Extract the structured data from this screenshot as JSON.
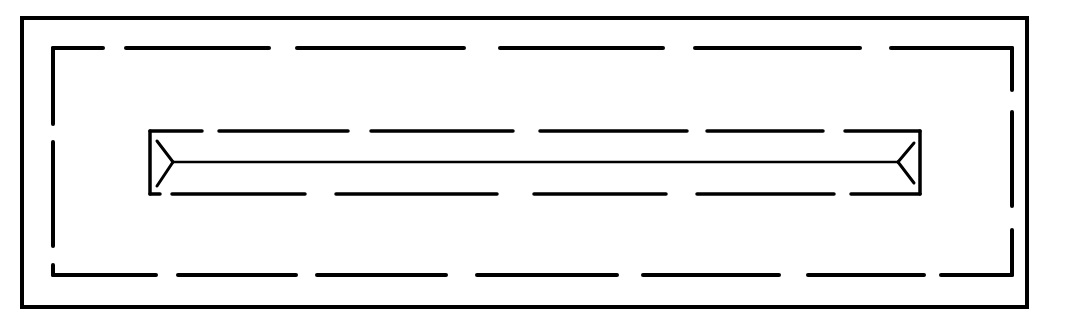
{
  "diagram": {
    "type": "line-drawing",
    "stroke_color": "#000000",
    "background_color": "#ffffff",
    "outer_frame": {
      "x": 22,
      "y": 18,
      "width": 1005,
      "height": 289,
      "stroke_width": 4
    },
    "outer_dashed_rect": {
      "left": 53,
      "right": 1012,
      "top": 48,
      "bottom": 275,
      "stroke_width": 4,
      "top_dashes": [
        [
          53,
          103
        ],
        [
          126,
          269
        ],
        [
          297,
          464
        ],
        [
          500,
          663
        ],
        [
          695,
          860
        ],
        [
          891,
          1012
        ]
      ],
      "bottom_dashes": [
        [
          53,
          156
        ],
        [
          178,
          296
        ],
        [
          317,
          446
        ],
        [
          477,
          617
        ],
        [
          643,
          779
        ],
        [
          808,
          924
        ],
        [
          941,
          1012
        ]
      ],
      "left_dashes": [
        [
          48,
          124
        ],
        [
          142,
          246
        ],
        [
          265,
          275
        ]
      ],
      "right_dashes": [
        [
          48,
          90
        ],
        [
          112,
          206
        ],
        [
          230,
          275
        ]
      ]
    },
    "inner_rect": {
      "left": 150,
      "right": 920,
      "top": 131,
      "bottom": 194,
      "stroke_width": 3.5,
      "top_dashes": [
        [
          150,
          202
        ],
        [
          219,
          348
        ],
        [
          371,
          513
        ],
        [
          540,
          687
        ],
        [
          707,
          823
        ],
        [
          845,
          920
        ]
      ],
      "bottom_dashes": [
        [
          150,
          160
        ],
        [
          172,
          305
        ],
        [
          336,
          497
        ],
        [
          534,
          666
        ],
        [
          697,
          834
        ],
        [
          851,
          920
        ]
      ],
      "left_side": [
        131,
        194
      ],
      "right_side": [
        131,
        194
      ]
    },
    "centerline": {
      "x1": 173,
      "x2": 898,
      "y": 162,
      "stroke_width": 2.5
    },
    "left_fork": {
      "tip": [
        173,
        162
      ],
      "arm_top": [
        157,
        141
      ],
      "arm_bottom": [
        157,
        186
      ]
    },
    "right_fork": {
      "tip": [
        898,
        162
      ],
      "arm_top": [
        914,
        143
      ],
      "arm_bottom": [
        914,
        183
      ]
    }
  }
}
